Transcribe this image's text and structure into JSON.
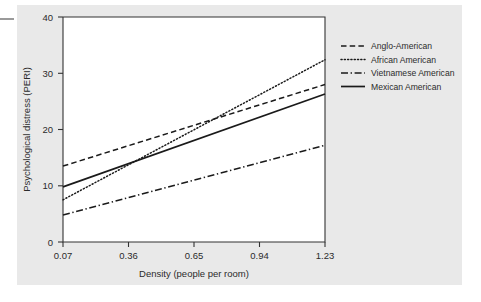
{
  "figure": {
    "background_panel_color": "#e9e9e9",
    "plot_background_color": "#ffffff",
    "axis_color": "#333333",
    "text_color": "#2b2b2b"
  },
  "chart_data": {
    "type": "line",
    "title": "",
    "xlabel": "Density (people per room)",
    "ylabel": "Psychological distress (PERI)",
    "xlim": [
      0.07,
      1.23
    ],
    "ylim": [
      0,
      40
    ],
    "xticks": [
      "0.07",
      "0.36",
      "0.65",
      "0.94",
      "1.23"
    ],
    "xtick_values": [
      0.07,
      0.36,
      0.65,
      0.94,
      1.23
    ],
    "yticks": [
      "0",
      "10",
      "20",
      "30",
      "40"
    ],
    "ytick_values": [
      0,
      10,
      20,
      30,
      40
    ],
    "grid": false,
    "legend_position": "right-outside",
    "x": [
      0.07,
      1.23
    ],
    "series": [
      {
        "name": "Anglo-American",
        "style": "dashed",
        "color": "#1a1a1a",
        "values": [
          13.5,
          28.0
        ]
      },
      {
        "name": "African American",
        "style": "dotted",
        "color": "#1a1a1a",
        "values": [
          7.5,
          32.4
        ]
      },
      {
        "name": "Vietnamese American",
        "style": "dash-dot",
        "color": "#1a1a1a",
        "values": [
          4.8,
          17.2
        ]
      },
      {
        "name": "Mexican American",
        "style": "solid",
        "color": "#1a1a1a",
        "values": [
          9.8,
          26.3
        ]
      }
    ]
  },
  "legend": {
    "items": [
      {
        "label": "Anglo-American",
        "style": "dashed"
      },
      {
        "label": "African American",
        "style": "dotted"
      },
      {
        "label": "Vietnamese American",
        "style": "dash-dot"
      },
      {
        "label": "Mexican American",
        "style": "solid"
      }
    ]
  }
}
